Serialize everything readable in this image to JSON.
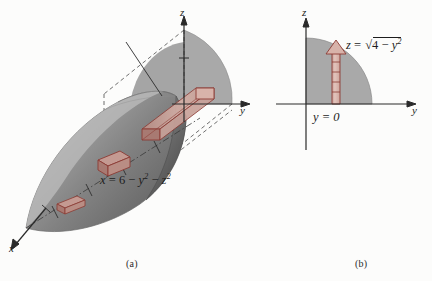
{
  "figure": {
    "background_color": "#fcfcfb"
  },
  "panel_a": {
    "caption": "(a)",
    "equation": "x = 6 − y² − z²",
    "equation_parts": {
      "lhs": "x",
      "equals": "=",
      "constant": "6",
      "minus_1": "−",
      "y_base": "y",
      "y_exp": "2",
      "minus_2": "−",
      "z_base": "z",
      "z_exp": "2"
    },
    "axes": {
      "x_label": "x",
      "y_label": "y",
      "z_label": "z"
    },
    "colors": {
      "solid_light": "#b9b9b9",
      "solid_mid": "#8e8e8e",
      "solid_dark": "#5a5a5a",
      "disk_gray": "#a9a9a9",
      "box_outline": "#8c3b34",
      "box_fill": "#c49a92",
      "axis": "#2a2a2a",
      "dashed": "#4a4a4a"
    }
  },
  "panel_b": {
    "caption": "(b)",
    "equation_curve": "z = √(4 − y²)",
    "equation_curve_parts": {
      "lhs": "z",
      "equals": "=",
      "radicand_constant": "4",
      "minus": "−",
      "y_base": "y",
      "y_exp": "2"
    },
    "equation_baseline": "y = 0",
    "axes": {
      "y_label": "y",
      "z_label": "z"
    },
    "colors": {
      "region_gray": "#a9a9a9",
      "strip_fill": "#d8b3aa",
      "strip_outline": "#8c3b34",
      "axis": "#2a2a2a"
    }
  }
}
